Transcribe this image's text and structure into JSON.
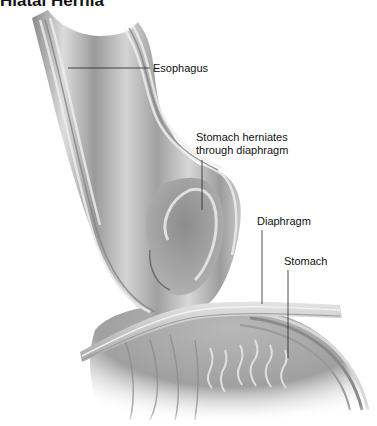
{
  "title": "Hiatal Hernia",
  "labels": {
    "esophagus": "Esophagus",
    "herniation_line1": "Stomach herniates",
    "herniation_line2": "through diaphragm",
    "diaphragm": "Diaphragm",
    "stomach": "Stomach"
  },
  "colors": {
    "tissue_light": "#d9d9d9",
    "tissue_mid": "#a8a8a8",
    "tissue_dark": "#7a7a7a",
    "leader_line": "#222222"
  }
}
